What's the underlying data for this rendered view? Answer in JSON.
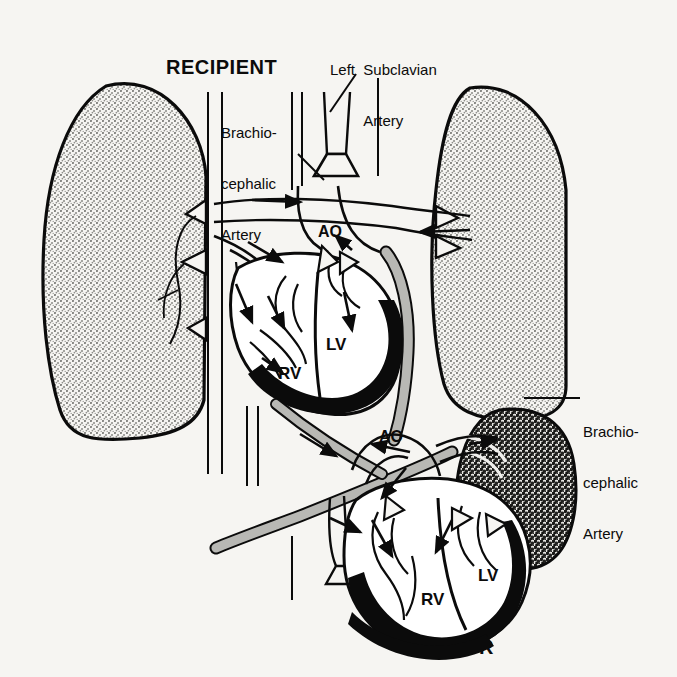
{
  "figure": {
    "kind": "medical-illustration",
    "background_color": "#f6f5f2",
    "ink_color": "#0b0b0b",
    "myocardium_fill": "#0b0b0b",
    "chamber_fill": "#ffffff",
    "graft_vessel_fill": "#b8b8b4",
    "recipient_lung_tone": "#a8a8a4",
    "donor_lung_tone": "#3a3a38"
  },
  "captions": {
    "recipient": "RECIPIENT",
    "donor": "DONOR"
  },
  "labels": {
    "left_subclavian_artery": {
      "line1": "Left  Subclavian",
      "line2": "Artery"
    },
    "brachiocephalic_artery_left": {
      "line1": "Brachio-",
      "line2": "cephalic",
      "line3": "Artery"
    },
    "brachiocephalic_artery_right": {
      "line1": "Brachio-",
      "line2": "cephalic",
      "line3": "Artery"
    }
  },
  "chamber_labels": {
    "recipient_aorta": "AO",
    "recipient_left_ventricle": "LV",
    "recipient_right_ventricle": "RV",
    "donor_aorta": "AO",
    "donor_left_ventricle": "LV",
    "donor_right_ventricle": "RV"
  },
  "organs": [
    {
      "name": "recipient-left-lung",
      "tone": "light-stipple"
    },
    {
      "name": "recipient-right-lung",
      "tone": "light-stipple"
    },
    {
      "name": "donor-lung",
      "tone": "dark-stipple"
    },
    {
      "name": "recipient-heart",
      "tone": "outline-with-black-myocardium"
    },
    {
      "name": "donor-heart",
      "tone": "outline-with-black-myocardium"
    }
  ]
}
